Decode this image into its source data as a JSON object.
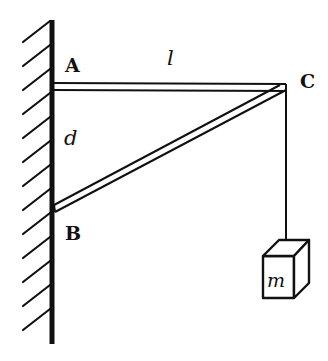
{
  "diagram": {
    "type": "statics-bracket",
    "labels": {
      "A": "A",
      "B": "B",
      "C": "C",
      "length": "l",
      "distance": "d",
      "mass": "m"
    },
    "colors": {
      "ink": "#111111",
      "background": "#ffffff"
    },
    "elements": [
      "wall (hatched, left)",
      "horizontal beam A–C of length l",
      "diagonal strut B–C",
      "vertical distance d between A and B on wall",
      "rope hanging from C",
      "block of mass m"
    ]
  }
}
